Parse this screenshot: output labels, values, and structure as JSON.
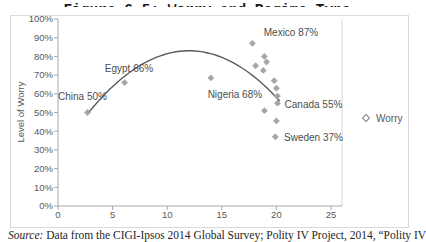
{
  "title": "Figure 6.5: Worry and Regime Type",
  "source": {
    "prefix": "Source:",
    "text": " Data from the CIGI-Ipsos 2014 Global Survey; Polity IV Project, 2014, “Polity IV"
  },
  "legend": {
    "label": "Worry"
  },
  "colors": {
    "marker": "#a6a6a6",
    "trendline": "#595959",
    "axis": "#a6a6a6",
    "plot_border": "#d9d9d9",
    "tick_text": "#595959",
    "label_text": "#4d4d4d"
  },
  "chart_data": {
    "type": "scatter",
    "title": "Figure 6.5: Worry and Regime Type",
    "xlabel": "",
    "ylabel": "Level of Worry",
    "xlim": [
      0,
      25
    ],
    "ylim": [
      0,
      100
    ],
    "grid": false,
    "legend_position": "right",
    "x_ticks": [
      0,
      5,
      10,
      15,
      20,
      25
    ],
    "y_ticks": [
      [
        0,
        "0%"
      ],
      [
        10,
        "10%"
      ],
      [
        20,
        "20%"
      ],
      [
        30,
        "30%"
      ],
      [
        40,
        "40%"
      ],
      [
        50,
        "50%"
      ],
      [
        60,
        "60%"
      ],
      [
        70,
        "70%"
      ],
      [
        80,
        "80%"
      ],
      [
        90,
        "90%"
      ],
      [
        100,
        "100%"
      ]
    ],
    "series": [
      {
        "name": "Worry",
        "marker": "diamond",
        "points": [
          {
            "x": 2.7,
            "y": 50,
            "label": "China 50%",
            "lox": -5,
            "loy": -16.5
          },
          {
            "x": 6.1,
            "y": 66,
            "label": "Egypt 66%",
            "lox": 4.4,
            "loy": -13.6
          },
          {
            "x": 14.0,
            "y": 68.5,
            "label": "Nigeria 68%",
            "lox": 24,
            "loy": 16.6
          },
          {
            "x": 17.8,
            "y": 87,
            "label": "Mexico 87%",
            "lox": 38.6,
            "loy": -10.8
          },
          {
            "x": 20.1,
            "y": 55,
            "label": "Canada 55%",
            "lox": 36,
            "loy": 1.3
          },
          {
            "x": 19.9,
            "y": 37,
            "label": "Sweden 37%",
            "lox": 38.2,
            "loy": 0.7
          },
          {
            "x": 18.9,
            "y": 80
          },
          {
            "x": 19.1,
            "y": 77
          },
          {
            "x": 18.1,
            "y": 75
          },
          {
            "x": 18.8,
            "y": 72.5
          },
          {
            "x": 19.8,
            "y": 67
          },
          {
            "x": 20.0,
            "y": 63
          },
          {
            "x": 20.1,
            "y": 58.8
          },
          {
            "x": 18.9,
            "y": 51
          },
          {
            "x": 20.0,
            "y": 45.5
          }
        ]
      }
    ],
    "trendline": {
      "type": "quadratic",
      "vertex_x": 12,
      "vertex_y": 83,
      "a": 0.39,
      "x_start": 2.7,
      "x_end": 20.3
    }
  }
}
